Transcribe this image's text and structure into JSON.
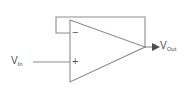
{
  "diagram": {
    "type": "circuit-schematic",
    "background_color": "#ffffff",
    "line_color": "#808080",
    "text_color": "#4d4d4d",
    "labels": {
      "input": {
        "base": "V",
        "sub": "In"
      },
      "output": {
        "base": "V",
        "sub": "Out"
      }
    },
    "terminals": {
      "inverting": "−",
      "non_inverting": "+"
    },
    "components": [
      {
        "name": "op-amp",
        "shape": "triangle",
        "apex_x": 145,
        "apex_y": 47,
        "left_edge_x": 70,
        "top_y": 20,
        "bottom_y": 82
      }
    ],
    "wires": [
      {
        "name": "input-wire",
        "from_x": 33,
        "from_y": 62,
        "to_x": 70,
        "to_y": 62
      },
      {
        "name": "output-wire",
        "from_x": 145,
        "from_y": 47,
        "to_x": 155,
        "to_y": 47
      },
      {
        "name": "feedback-up",
        "from_x": 145,
        "from_y": 47,
        "to_x": 145,
        "to_y": 17
      },
      {
        "name": "feedback-top",
        "from_x": 145,
        "from_y": 17,
        "to_x": 56,
        "to_y": 17
      },
      {
        "name": "feedback-down",
        "from_x": 56,
        "from_y": 17,
        "to_x": 56,
        "to_y": 33
      },
      {
        "name": "feedback-into-minus",
        "from_x": 56,
        "from_y": 33,
        "to_x": 70,
        "to_y": 33
      }
    ],
    "arrows": [
      {
        "name": "output-arrowhead",
        "x": 155,
        "y": 47,
        "direction": "right"
      }
    ]
  }
}
